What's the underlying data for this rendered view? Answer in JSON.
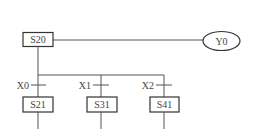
{
  "diagram": {
    "type": "sfc-divergence",
    "initial_step": {
      "label": "S20"
    },
    "output": {
      "label": "Y0"
    },
    "branches": [
      {
        "transition": "X0",
        "step": "S21"
      },
      {
        "transition": "X1",
        "step": "S31"
      },
      {
        "transition": "X2",
        "step": "S41"
      }
    ]
  },
  "colors": {
    "line": "#555555",
    "box_border": "#333333",
    "text": "#444444",
    "background": "#ffffff"
  }
}
